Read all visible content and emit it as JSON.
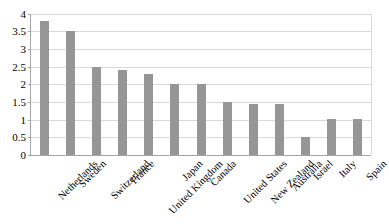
{
  "chart_data": {
    "type": "bar",
    "title": "",
    "subtitle": "",
    "xlabel": "",
    "ylabel": "",
    "categories": [
      "Netherlands",
      "Sweden",
      "Switzerland",
      "France",
      "United Kingdom",
      "Japan",
      "Canada",
      "United States",
      "New Zealand",
      "Australia",
      "Israel",
      "Italy",
      "Spain"
    ],
    "values": [
      3.8,
      3.5,
      2.5,
      2.4,
      2.3,
      2.0,
      2.0,
      1.5,
      1.43,
      1.43,
      0.52,
      1.03,
      1.03
    ],
    "ylim": [
      0,
      4
    ],
    "ytick_labels": [
      "4",
      "3.5",
      "3",
      "2.5",
      "2",
      "1.5",
      "1",
      "0.5",
      "0"
    ],
    "ytick_values": [
      4,
      3.5,
      3,
      2.5,
      2,
      1.5,
      1,
      0.5,
      0
    ],
    "grid": true,
    "legend": false,
    "legend_position": "none",
    "bar_color": "#969696",
    "gridline_color": "#d9d9d9",
    "axis_color": "#a6a6a6",
    "background_color": "#ffffff"
  }
}
